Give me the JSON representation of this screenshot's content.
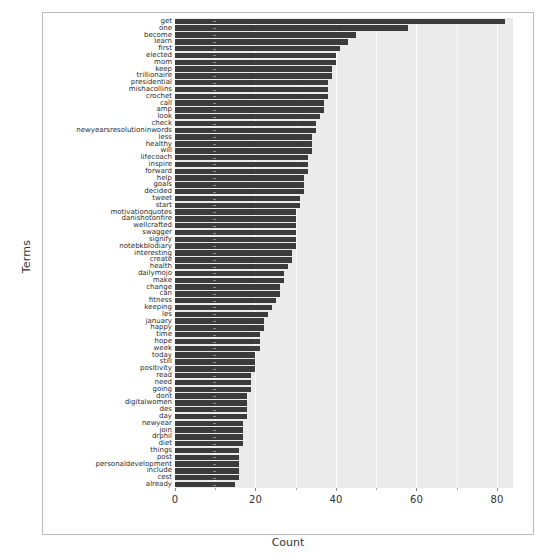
{
  "chart_data": {
    "type": "bar",
    "orientation": "horizontal",
    "title": "",
    "xlabel": "Count",
    "ylabel": "Terms",
    "xlim": [
      0,
      84
    ],
    "xticks": [
      0,
      20,
      40,
      60,
      80
    ],
    "xtick_labels": [
      "0",
      "20",
      "40",
      "60",
      "80"
    ],
    "grid": true,
    "legend": "none",
    "bar_color": "#3b3b3b",
    "panel_color": "#ebebeb",
    "categories": [
      "get",
      "one",
      "become",
      "learn",
      "first",
      "elected",
      "mom",
      "keep",
      "trillionaire",
      "presidential",
      "mishacollins",
      "crochet",
      "call",
      "amp",
      "look",
      "check",
      "newyearsresolutioninwords",
      "less",
      "healthy",
      "will",
      "lifecoach",
      "inspire",
      "forward",
      "help",
      "goals",
      "decided",
      "tweet",
      "start",
      "motivationquotes",
      "danishotonfire",
      "wellcrafted",
      "swagger",
      "signify",
      "notebkblodiary",
      "interesting",
      "create",
      "health",
      "dailymojo",
      "make",
      "change",
      "can",
      "fitness",
      "keeping",
      "les",
      "january",
      "happy",
      "time",
      "hope",
      "week",
      "today",
      "still",
      "positivity",
      "read",
      "need",
      "going",
      "dont",
      "digitalwomen",
      "des",
      "day",
      "newyear",
      "join",
      "drphil",
      "diet",
      "things",
      "post",
      "personaldevelopment",
      "include",
      "cest",
      "already"
    ],
    "values": [
      82,
      58,
      45,
      43,
      41,
      40,
      40,
      39,
      39,
      38,
      38,
      38,
      37,
      37,
      36,
      35,
      35,
      34,
      34,
      34,
      33,
      33,
      33,
      32,
      32,
      32,
      31,
      31,
      30,
      30,
      30,
      30,
      30,
      30,
      29,
      29,
      28,
      27,
      27,
      26,
      26,
      25,
      24,
      23,
      22,
      22,
      21,
      21,
      21,
      20,
      20,
      20,
      19,
      19,
      19,
      18,
      18,
      18,
      18,
      17,
      17,
      17,
      17,
      16,
      16,
      16,
      16,
      16,
      15
    ]
  },
  "axes": {
    "x_title": "Count",
    "y_title": "Terms"
  }
}
